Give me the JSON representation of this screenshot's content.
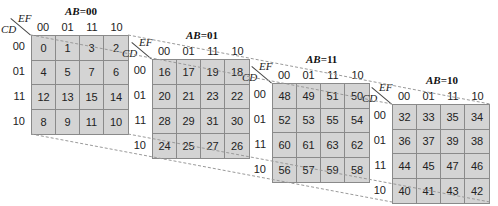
{
  "diagram": {
    "type": "4-variable-slice karnaugh maps (6-variable K-map)",
    "row_variable_label": "CD",
    "col_variable_label": "EF",
    "col_headers": [
      "00",
      "01",
      "11",
      "10"
    ],
    "row_headers": [
      "00",
      "01",
      "11",
      "10"
    ],
    "maps": [
      {
        "ab_var": "AB",
        "ab_value": "=00",
        "cells": [
          [
            "0",
            "1",
            "3",
            "2"
          ],
          [
            "4",
            "5",
            "7",
            "6"
          ],
          [
            "12",
            "13",
            "15",
            "14"
          ],
          [
            "8",
            "9",
            "11",
            "10"
          ]
        ]
      },
      {
        "ab_var": "AB",
        "ab_value": "=01",
        "cells": [
          [
            "16",
            "17",
            "19",
            "18"
          ],
          [
            "20",
            "21",
            "23",
            "22"
          ],
          [
            "28",
            "29",
            "31",
            "30"
          ],
          [
            "24",
            "25",
            "27",
            "26"
          ]
        ]
      },
      {
        "ab_var": "AB",
        "ab_value": "=11",
        "cells": [
          [
            "48",
            "49",
            "51",
            "50"
          ],
          [
            "52",
            "53",
            "55",
            "54"
          ],
          [
            "60",
            "61",
            "63",
            "62"
          ],
          [
            "56",
            "57",
            "59",
            "58"
          ]
        ]
      },
      {
        "ab_var": "AB",
        "ab_value": "=10",
        "cells": [
          [
            "32",
            "33",
            "35",
            "34"
          ],
          [
            "36",
            "37",
            "39",
            "38"
          ],
          [
            "44",
            "45",
            "47",
            "46"
          ],
          [
            "40",
            "41",
            "43",
            "42"
          ]
        ]
      }
    ],
    "colors": {
      "cell_fill": "#d4d4d4",
      "grid_line": "#8a8a8a",
      "dashed_connector": "#9a9a9a"
    }
  }
}
